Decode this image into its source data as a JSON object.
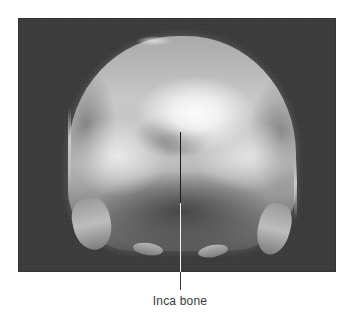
{
  "figure": {
    "annotation": {
      "label": "Inca bone"
    },
    "colors": {
      "page_background": "#ffffff",
      "photo_background": "#3b3b3b",
      "bone_highlight": "#fbfbfb",
      "label_text": "#3a3a3a"
    }
  }
}
